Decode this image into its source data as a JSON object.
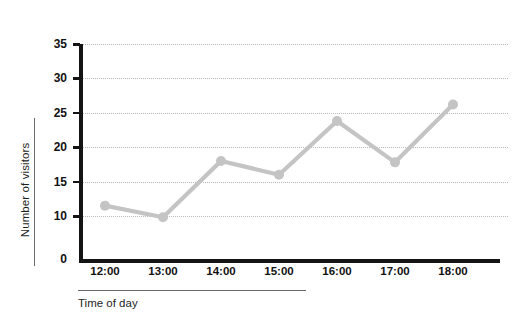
{
  "chart_data": {
    "type": "line",
    "title": "",
    "xlabel": "Time of day",
    "ylabel": "Number of visitors",
    "categories": [
      "12:00",
      "13:00",
      "14:00",
      "15:00",
      "16:00",
      "17:00",
      "18:00"
    ],
    "values": [
      11.5,
      9.7,
      18,
      16,
      23.8,
      17.8,
      26.2
    ],
    "series": [
      {
        "name": "Number of visitors",
        "values": [
          11.5,
          9.7,
          18,
          16,
          23.8,
          17.8,
          26.2
        ]
      }
    ],
    "ytick_labels": [
      "0",
      "10",
      "15",
      "20",
      "25",
      "30",
      "35"
    ],
    "ytick_values": [
      0,
      10,
      15,
      20,
      25,
      30,
      35
    ],
    "ylim": [
      0,
      35
    ],
    "axis_break": true,
    "grid": true,
    "grid_axis": "y",
    "legend": "none",
    "line_color": "#c4c4c4",
    "marker_color": "#c4c4c4",
    "grid_color": "#b9b9b9",
    "axis_color": "#141414"
  }
}
